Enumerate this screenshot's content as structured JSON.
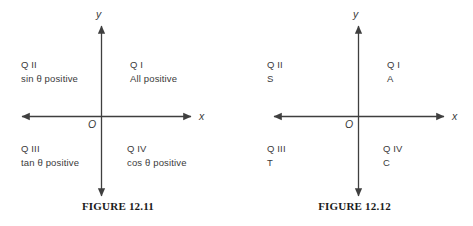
{
  "figures": [
    {
      "id": "figure-12-11",
      "caption": "FIGURE 12.11",
      "axis_labels": {
        "x": "x",
        "y": "y",
        "origin": "O"
      },
      "quadrants": [
        {
          "name": "Q I",
          "value": "All positive"
        },
        {
          "name": "Q II",
          "value": "sin θ positive"
        },
        {
          "name": "Q III",
          "value": "tan θ positive"
        },
        {
          "name": "Q IV",
          "value": "cos θ positive"
        }
      ]
    },
    {
      "id": "figure-12-12",
      "caption": "FIGURE 12.12",
      "axis_labels": {
        "x": "x",
        "y": "y",
        "origin": "O"
      },
      "quadrants": [
        {
          "name": "Q I",
          "value": "A"
        },
        {
          "name": "Q II",
          "value": "S"
        },
        {
          "name": "Q III",
          "value": "T"
        },
        {
          "name": "Q IV",
          "value": "C"
        }
      ]
    }
  ],
  "colors": {
    "background": "#ffffff",
    "axis": "#3f3f3f",
    "text": "#3a3a3a",
    "caption": "#1a1a1a"
  }
}
